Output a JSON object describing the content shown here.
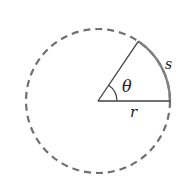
{
  "diagram": {
    "center": {
      "x": 98,
      "y": 101
    },
    "radius": 72,
    "angle_deg": 56,
    "colors": {
      "circle_dashed": "#707070",
      "arc_solid": "#808080",
      "radius_lines": "#404040",
      "angle_arc": "#404040",
      "text": "#222222"
    },
    "labels": {
      "theta": "θ",
      "arc_length": "s",
      "radius": "r"
    }
  }
}
